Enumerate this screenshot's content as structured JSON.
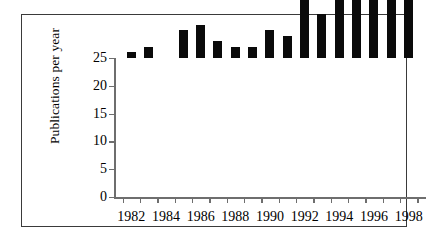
{
  "figure": {
    "frame_color": "#3a3a3a",
    "background": "#ffffff",
    "bar_color": "#0a0a0a",
    "axis_color": "#6e6e6e"
  },
  "axes": {
    "ylabel": "Publications per year",
    "yticks": [
      0,
      5,
      10,
      15,
      20,
      25
    ],
    "ytick_labels": [
      "0",
      "5",
      "10",
      "15",
      "20",
      "25"
    ],
    "xtick_labels": [
      "1982",
      "1984",
      "1986",
      "1988",
      "1990",
      "1992",
      "1994",
      "1996",
      "1998"
    ]
  },
  "chart_data": {
    "type": "bar",
    "title": "",
    "xlabel": "",
    "ylabel": "Publications per year",
    "categories": [
      "1982",
      "1983",
      "1984",
      "1985",
      "1986",
      "1987",
      "1988",
      "1989",
      "1990",
      "1991",
      "1992",
      "1993",
      "1994",
      "1995",
      "1996",
      "1997",
      "1998"
    ],
    "values": [
      1,
      2,
      0,
      5,
      6,
      3,
      2,
      2,
      5,
      4,
      11,
      8,
      19,
      13,
      16,
      19,
      23.5
    ],
    "ylim": [
      0,
      25
    ],
    "xlim": [
      "1981",
      "1999"
    ],
    "ytick_interval": 5,
    "xtick_label_interval": 2,
    "grid": false,
    "legend": null,
    "series": [
      {
        "name": "Publications per year",
        "values": [
          1,
          2,
          0,
          5,
          6,
          3,
          2,
          2,
          5,
          4,
          11,
          8,
          19,
          13,
          16,
          19,
          23.5
        ]
      }
    ]
  }
}
